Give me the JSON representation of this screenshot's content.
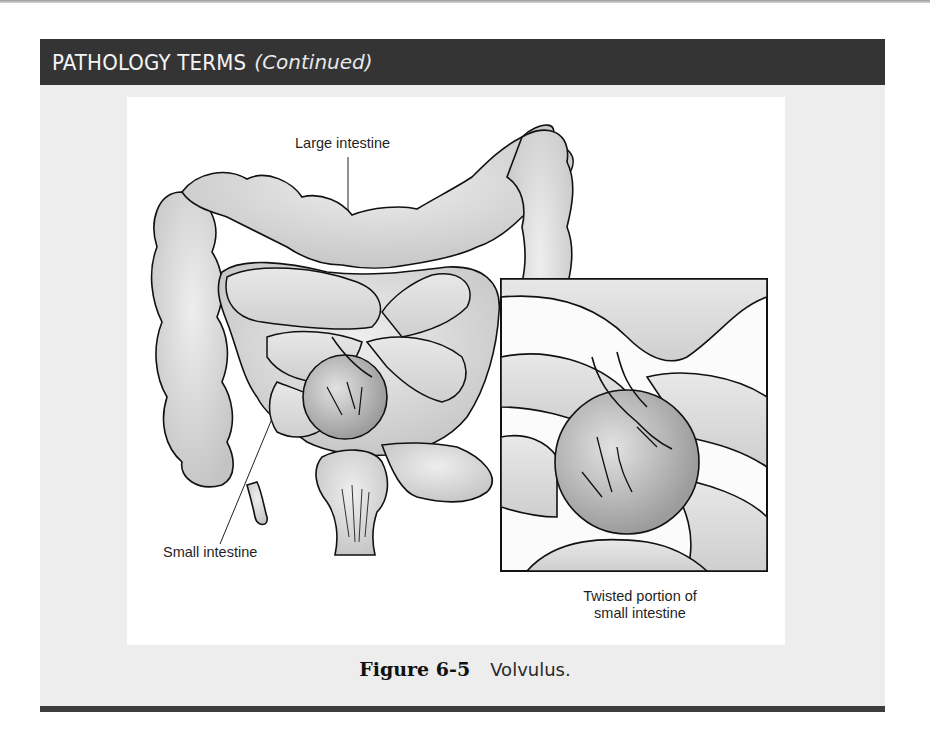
{
  "header": {
    "title": "PATHOLOGY TERMS",
    "subtitle": "(Continued)"
  },
  "figure": {
    "labels": {
      "large_intestine": "Large intestine",
      "small_intestine": "Small intestine",
      "inset_line1": "Twisted portion of",
      "inset_line2": "small intestine"
    },
    "caption": {
      "number": "Figure 6-5",
      "text": "Volvulus."
    }
  },
  "colors": {
    "header_bg": "#343434",
    "panel_bg": "#ededed",
    "figure_bg": "#ffffff",
    "organ_fill": "#d6d6d6",
    "outline": "#111111"
  }
}
